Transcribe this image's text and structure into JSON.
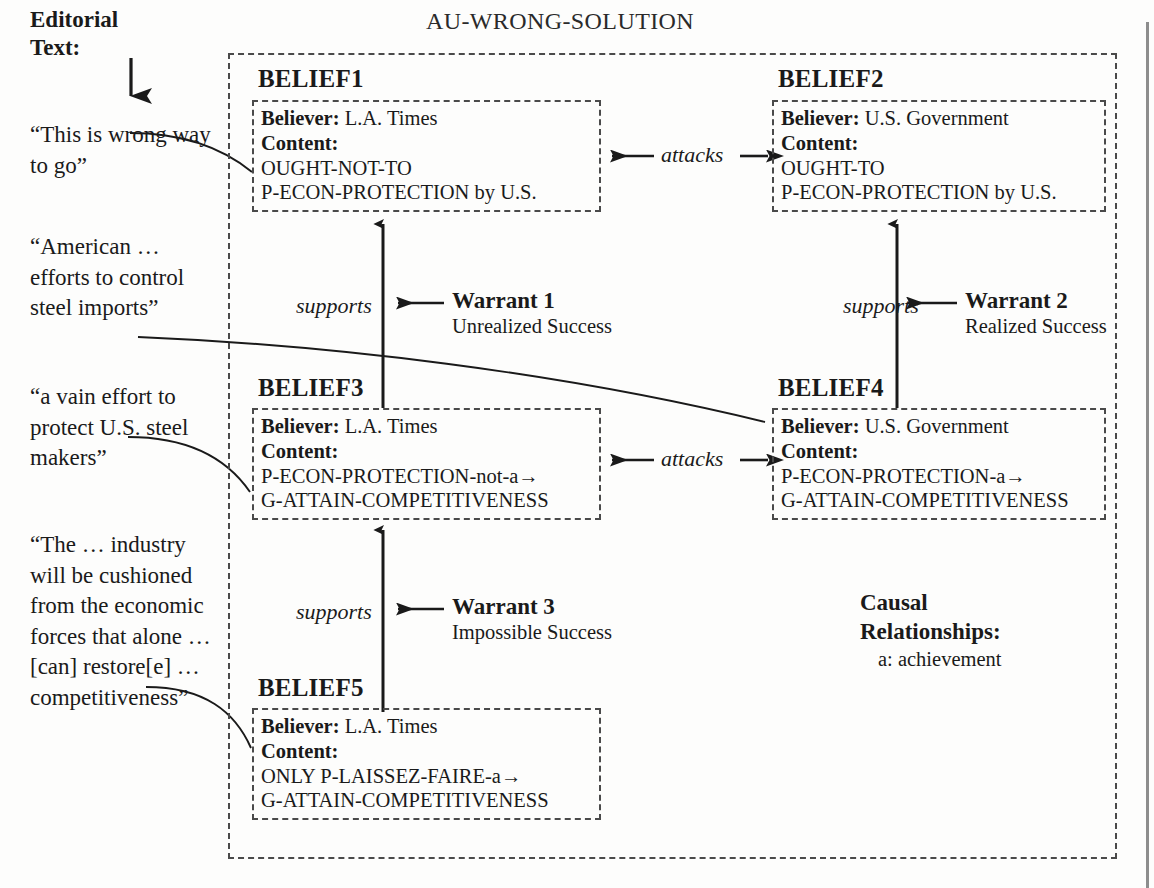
{
  "title": "AU-WRONG-SOLUTION",
  "editorial": {
    "heading": "Editorial\nText:",
    "arrow_icon": "down-arrow-icon",
    "quotes": [
      "“This is wrong way to go”",
      "“American … efforts to control steel imports”",
      "“a vain effort to protect U.S. steel makers”",
      "“The … industry will be cushioned from the economic forces that alone … [can] restore[e] … competitiveness”"
    ]
  },
  "beliefs": [
    {
      "id": "BELIEF1",
      "believer_label": "Believer:",
      "believer": "L.A. Times",
      "content_label": "Content:",
      "content_lines": [
        "OUGHT-NOT-TO",
        "P-ECON-PROTECTION by U.S."
      ]
    },
    {
      "id": "BELIEF2",
      "believer_label": "Believer:",
      "believer": "U.S. Government",
      "content_label": "Content:",
      "content_lines": [
        "OUGHT-TO",
        "P-ECON-PROTECTION by U.S."
      ]
    },
    {
      "id": "BELIEF3",
      "believer_label": "Believer:",
      "believer": "L.A. Times",
      "content_label": "Content:",
      "content_lines": [
        "P-ECON-PROTECTION-not-a→",
        "G-ATTAIN-COMPETITIVENESS"
      ]
    },
    {
      "id": "BELIEF4",
      "believer_label": "Believer:",
      "believer": "U.S. Government",
      "content_label": "Content:",
      "content_lines": [
        "P-ECON-PROTECTION-a→",
        "G-ATTAIN-COMPETITIVENESS"
      ]
    },
    {
      "id": "BELIEF5",
      "believer_label": "Believer:",
      "believer": "L.A. Times",
      "content_label": "Content:",
      "content_lines": [
        "ONLY P-LAISSEZ-FAIRE-a→",
        "G-ATTAIN-COMPETITIVENESS"
      ]
    }
  ],
  "warrants": [
    {
      "name": "Warrant 1",
      "subtitle": "Unrealized Success",
      "relation": "supports"
    },
    {
      "name": "Warrant 2",
      "subtitle": "Realized Success",
      "relation": "supports"
    },
    {
      "name": "Warrant 3",
      "subtitle": "Impossible Success",
      "relation": "supports"
    }
  ],
  "attacks": [
    {
      "label": "attacks"
    },
    {
      "label": "attacks"
    }
  ],
  "legend": {
    "title": "Causal\nRelationships:",
    "items": [
      "a: achievement"
    ]
  },
  "colors": {
    "ink": "#1a1a1a",
    "dash": "#4a4a4a",
    "rule": "#8d8d8d",
    "background": "#fdfdfc"
  }
}
